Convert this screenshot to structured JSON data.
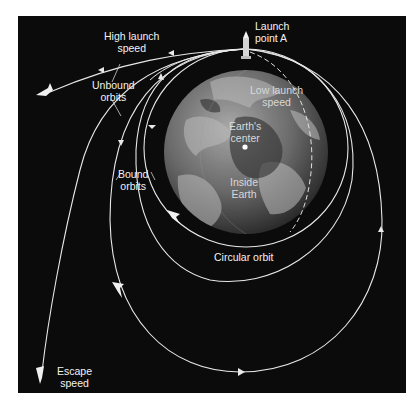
{
  "diagram": {
    "labels": {
      "high_launch_speed": "High launch\nspeed",
      "launch_point": "Launch\npoint A",
      "unbound_orbits": "Unbound\norbits",
      "low_launch_speed": "Low launch\nspeed",
      "earths_center": "Earth's\ncenter",
      "bound_orbits": "Bound\norbits",
      "inside_earth": "Inside\nEarth",
      "circular_orbit": "Circular orbit",
      "escape_speed": "Escape\nspeed"
    },
    "icons": {
      "rocket": "rocket-icon",
      "spacecraft": "spacecraft-icon",
      "earth": "earth-globe",
      "center_point": "center-dot"
    },
    "colors": {
      "background": "#0b0b0b",
      "orbit_line": "#e8e8e8",
      "earth_light": "#9a9a9a",
      "earth_dark": "#3a3a3a",
      "text": "#f2f2f2"
    }
  }
}
